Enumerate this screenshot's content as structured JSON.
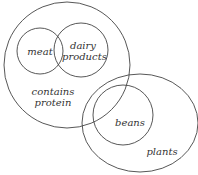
{
  "diagram": {
    "type": "venn",
    "stroke_color": "#444444",
    "sets": [
      {
        "id": "contains-protein",
        "label": "contains\nprotein"
      },
      {
        "id": "meat",
        "label": "meat"
      },
      {
        "id": "dairy-products",
        "label": "dairy\nproducts"
      },
      {
        "id": "plants",
        "label": "plants"
      },
      {
        "id": "beans",
        "label": "beans"
      }
    ]
  }
}
